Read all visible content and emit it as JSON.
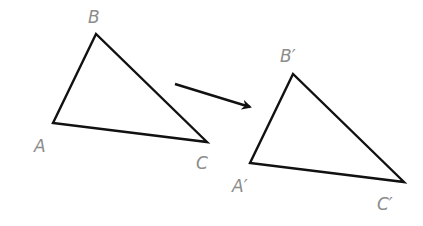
{
  "diagram": {
    "type": "translation",
    "colors": {
      "stroke": "#111111",
      "label": "#8c8c8c",
      "background": "#ffffff"
    },
    "original": {
      "name": "triangle-ABC",
      "vertices": {
        "A": {
          "label": "A",
          "x": 53,
          "y": 123
        },
        "B": {
          "label": "B",
          "x": 96,
          "y": 34
        },
        "C": {
          "label": "C",
          "x": 207,
          "y": 142
        }
      }
    },
    "image": {
      "name": "triangle-A'B'C'",
      "vertices": {
        "A": {
          "label": "A′",
          "x": 250,
          "y": 163
        },
        "B": {
          "label": "B′",
          "x": 293,
          "y": 74
        },
        "C": {
          "label": "C′",
          "x": 404,
          "y": 182
        }
      }
    },
    "arrow": {
      "from": {
        "x": 175,
        "y": 84
      },
      "to": {
        "x": 252,
        "y": 108
      },
      "meaning": "maps original to image"
    }
  }
}
